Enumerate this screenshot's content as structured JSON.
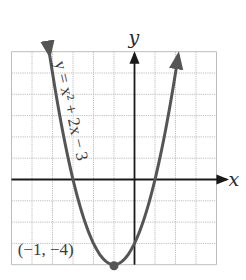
{
  "chart_data": {
    "type": "line",
    "title": "",
    "equation": "y = x^2 + 2x − 3",
    "equation_label": "y = x² + 2x − 3",
    "xlabel": "x",
    "ylabel": "y",
    "xlim": [
      -6,
      4
    ],
    "ylim": [
      -4,
      6
    ],
    "grid": true,
    "grid_step": 1,
    "series": [
      {
        "name": "y = x^2 + 2x - 3",
        "function": "x^2 + 2x - 3",
        "x": [
          -4.6,
          -4,
          -3,
          -2,
          -1,
          0,
          1,
          2,
          2.6
        ],
        "y": [
          5.96,
          5,
          0,
          -3,
          -4,
          -3,
          0,
          5,
          8.96
        ]
      }
    ],
    "annotations": [
      {
        "text": "(−1, −4)",
        "x": -1,
        "y": -4,
        "type": "vertex-point"
      }
    ],
    "colors": {
      "curve": "#555555",
      "axes": "#1a1a1a",
      "grid": "#bdbdbd"
    }
  }
}
